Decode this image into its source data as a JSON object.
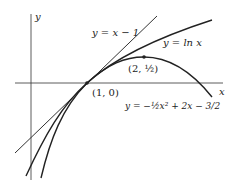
{
  "diagram": {
    "axes": {
      "x_label": "x",
      "y_label": "y"
    },
    "curves": [
      {
        "name": "tangent-line",
        "label": "y = x − 1"
      },
      {
        "name": "ln-curve",
        "label": "y = ln x"
      },
      {
        "name": "parabola",
        "label": "y = −½x² + 2x − 3/2"
      }
    ],
    "points": [
      {
        "name": "point-1-0",
        "label": "(1, 0)"
      },
      {
        "name": "point-2-half",
        "label": "(2, ½)"
      }
    ]
  }
}
